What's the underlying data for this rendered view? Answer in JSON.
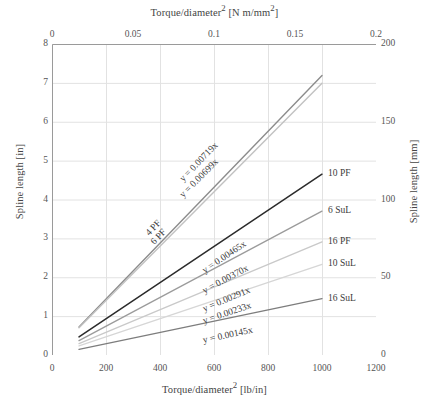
{
  "chart_data": {
    "type": "line",
    "title": "",
    "xlabel": "Torque/diameter² [lb/in]",
    "xlabel_top": "Torque/diameter² [N m/mm²]",
    "ylabel": "Spline length [in]",
    "ylabel_right": "Spline length [mm]",
    "grid": true,
    "legend_position": "inline-right-of-line-ends",
    "xlim": [
      0,
      1200
    ],
    "xlim_top": [
      0,
      0.2
    ],
    "ylim": [
      0,
      8
    ],
    "ylim_right": [
      0,
      200
    ],
    "xticks": [
      "0",
      "200",
      "400",
      "600",
      "800",
      "1000",
      "1200"
    ],
    "xticks_top": [
      "0",
      "0.05",
      "0.1",
      "0.15",
      "0.2"
    ],
    "yticks": [
      "0",
      "1",
      "2",
      "3",
      "4",
      "5",
      "6",
      "7",
      "8"
    ],
    "yticks_right": [
      "0",
      "50",
      "100",
      "150",
      "200"
    ],
    "x_start": 100,
    "series": [
      {
        "name": "4 PF",
        "equation": "y = 0.00719x",
        "slope": 0.00719,
        "x_end": 1000,
        "color": "#8c8c8c",
        "width": 1.4
      },
      {
        "name": "6 PF",
        "equation": "y = 0.00699x",
        "slope": 0.00699,
        "x_end": 1000,
        "color": "#c2c2c2",
        "width": 1.4
      },
      {
        "name": "10 PF",
        "equation": "y = 0.00465x",
        "slope": 0.00465,
        "x_end": 1000,
        "color": "#2b2b2b",
        "width": 1.5
      },
      {
        "name": "6 SuL",
        "equation": "y = 0.00370x",
        "slope": 0.0037,
        "x_end": 1000,
        "color": "#9b9b9b",
        "width": 1.3
      },
      {
        "name": "16 PF",
        "equation": "y = 0.00291x",
        "slope": 0.00291,
        "x_end": 1000,
        "color": "#c9c9c9",
        "width": 1.3
      },
      {
        "name": "10 SuL",
        "equation": "y = 0.00233x",
        "slope": 0.00233,
        "x_end": 1000,
        "color": "#d6d6d6",
        "width": 1.3
      },
      {
        "name": "16 SuL",
        "equation": "y = 0.00145x",
        "slope": 0.00145,
        "x_end": 1000,
        "color": "#7d7d7d",
        "width": 1.3
      }
    ]
  },
  "colors": {
    "grid": "#e2e2e2",
    "axis": "#9a9a9a",
    "text": "#444444",
    "background": "#ffffff"
  }
}
